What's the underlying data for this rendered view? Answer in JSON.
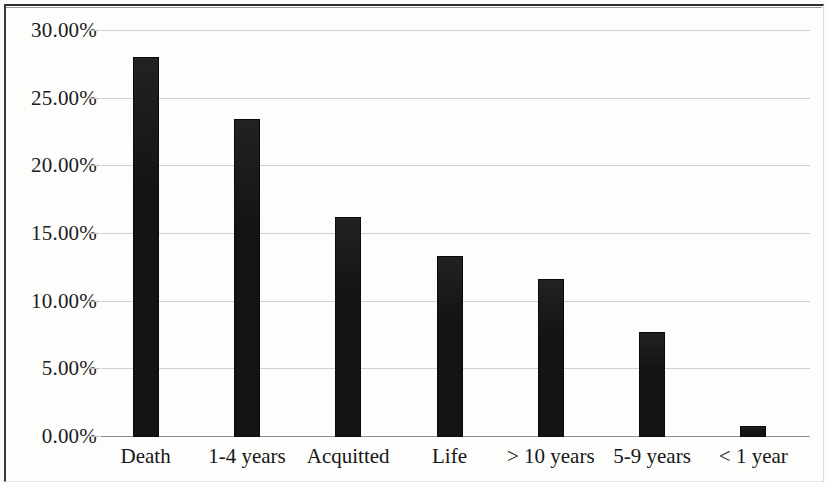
{
  "chart_data": {
    "type": "bar",
    "title": "",
    "subtitle": "",
    "xlabel": "",
    "ylabel": "",
    "categories": [
      "Death",
      "1-4 years",
      "Acquitted",
      "Life",
      "> 10 years",
      "5-9 years",
      "< 1 year"
    ],
    "values": [
      27.9,
      23.35,
      16.1,
      13.2,
      11.5,
      7.6,
      0.65
    ],
    "value_labels": [
      "27.90%",
      "23.35%",
      "16.10%",
      "13.20%",
      "11.50%",
      "7.60%",
      "0.65%"
    ],
    "ylim": [
      0,
      30
    ],
    "ytick_values": [
      30,
      25,
      20,
      15,
      10,
      5,
      0
    ],
    "ytick_labels": [
      "30.00%",
      "25.00%",
      "20.00%",
      "15.00%",
      "10.00%",
      "5.00%",
      "0.00%"
    ],
    "grid": true,
    "grid_axis": "y",
    "legend": false,
    "legend_position": "none",
    "series": [
      {
        "name": "Share of cases",
        "values": [
          27.9,
          23.35,
          16.1,
          13.2,
          11.5,
          7.6,
          0.65
        ]
      }
    ],
    "colors": {
      "bar": "#141414",
      "gridline": "#cfcfcd",
      "axis": "#8d8d8b",
      "text": "#1b1b1b",
      "background": "#fdfdfc",
      "frame": "#2e2e2e"
    }
  }
}
